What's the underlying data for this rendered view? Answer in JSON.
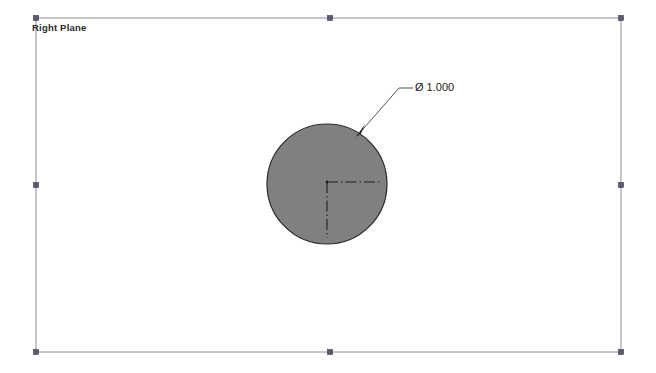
{
  "viewport": {
    "width": 656,
    "height": 373,
    "background_color": "#ffffff"
  },
  "plane": {
    "label": "Right Plane",
    "border_color": "#8c8c99",
    "handle_color": "#5a5a70",
    "rect": {
      "x1": 36,
      "y1": 18,
      "x2": 621,
      "y2": 352
    },
    "handles": [
      {
        "name": "corner-top-left",
        "x": 36,
        "y": 18
      },
      {
        "name": "midpoint-top",
        "x": 330,
        "y": 18
      },
      {
        "name": "corner-top-right",
        "x": 621,
        "y": 18
      },
      {
        "name": "midpoint-right",
        "x": 621,
        "y": 185
      },
      {
        "name": "corner-bottom-right",
        "x": 621,
        "y": 352
      },
      {
        "name": "midpoint-bottom",
        "x": 330,
        "y": 352
      },
      {
        "name": "corner-bottom-left",
        "x": 36,
        "y": 352
      },
      {
        "name": "midpoint-left",
        "x": 36,
        "y": 185
      }
    ]
  },
  "circle": {
    "center_x": 327,
    "center_y": 184,
    "radius": 60,
    "fill_color": "#808080",
    "stroke_color": "#2b2b2b"
  },
  "centerline": {
    "color": "#1f1f1f",
    "horizontal": {
      "x1": 327,
      "y1": 182,
      "x2": 381,
      "y2": 182
    },
    "vertical": {
      "x1": 327,
      "y1": 182,
      "x2": 327,
      "y2": 238
    }
  },
  "dimension": {
    "symbol": "Ø",
    "value": "1.000",
    "text": "Ø 1.000",
    "leader_color": "#555560",
    "arrow_tip": {
      "x": 357,
      "y": 136
    },
    "elbow": {
      "x": 399,
      "y": 88
    },
    "shoulder": {
      "x": 413,
      "y": 88
    }
  }
}
